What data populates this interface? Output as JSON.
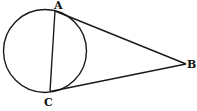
{
  "diagram": {
    "points": [
      {
        "id": "A",
        "label": "A"
      },
      {
        "id": "B",
        "label": "B"
      },
      {
        "id": "C",
        "label": "C"
      }
    ],
    "segments": [
      {
        "from": "A",
        "to": "C",
        "kind": "chord"
      },
      {
        "from": "A",
        "to": "B",
        "kind": "tangent"
      },
      {
        "from": "C",
        "to": "B",
        "kind": "tangent"
      }
    ],
    "shapes": [
      {
        "kind": "circle",
        "passes_through": [
          "A",
          "C"
        ]
      }
    ],
    "colors": {
      "ink": "#1a1a1a",
      "background": "#ffffff"
    }
  }
}
